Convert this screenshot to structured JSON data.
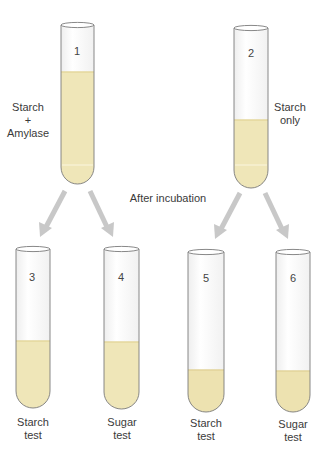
{
  "diagram": {
    "caption": "After incubation",
    "colors": {
      "liquid": "#ede4b4",
      "liquid_edge": "#e2d59b",
      "glass_stroke": "#7a7a7a",
      "arrow": "#c8c8c8",
      "glass_fill": "#fbfbfb"
    },
    "tubes": [
      {
        "id": "1",
        "number": "1",
        "label_line1": "Starch",
        "label_line2": "+",
        "label_line3": "Amylase",
        "fill_level": "high"
      },
      {
        "id": "2",
        "number": "2",
        "label_line1": "Starch",
        "label_line2": "only",
        "fill_level": "medium"
      },
      {
        "id": "3",
        "number": "3",
        "label_line1": "Starch",
        "label_line2": "test",
        "fill_level": "medium"
      },
      {
        "id": "4",
        "number": "4",
        "label_line1": "Sugar",
        "label_line2": "test",
        "fill_level": "medium"
      },
      {
        "id": "5",
        "number": "5",
        "label_line1": "Starch",
        "label_line2": "test",
        "fill_level": "low"
      },
      {
        "id": "6",
        "number": "6",
        "label_line1": "Sugar",
        "label_line2": "test",
        "fill_level": "low"
      }
    ],
    "arrows": [
      {
        "from": "1",
        "to": "3"
      },
      {
        "from": "1",
        "to": "4"
      },
      {
        "from": "2",
        "to": "5"
      },
      {
        "from": "2",
        "to": "6"
      }
    ]
  }
}
